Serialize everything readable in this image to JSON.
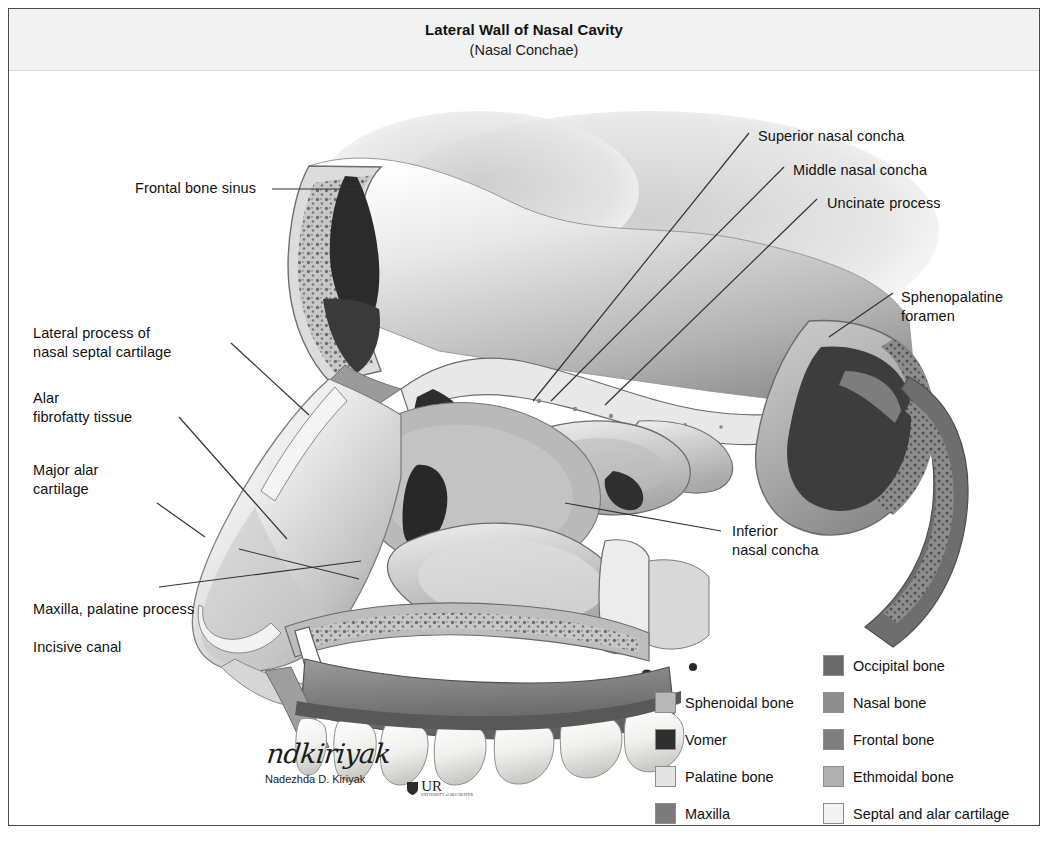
{
  "figure": {
    "title_main": "Lateral Wall of Nasal Cavity",
    "title_sub": "(Nasal Conchae)"
  },
  "labels": [
    {
      "id": "frontal-bone-sinus",
      "text": "Frontal bone sinus"
    },
    {
      "id": "lateral-process-septal-cartilage",
      "text": "Lateral process of\nnasal septal cartilage"
    },
    {
      "id": "alar-fibrofatty-tissue",
      "text": "Alar\nfibrofatty tissue"
    },
    {
      "id": "major-alar-cartilage",
      "text": "Major alar\ncartilage"
    },
    {
      "id": "maxilla-palatine-process",
      "text": "Maxilla, palatine process"
    },
    {
      "id": "incisive-canal",
      "text": "Incisive canal"
    },
    {
      "id": "superior-nasal-concha",
      "text": "Superior nasal concha"
    },
    {
      "id": "middle-nasal-concha",
      "text": "Middle nasal concha"
    },
    {
      "id": "uncinate-process",
      "text": "Uncinate process"
    },
    {
      "id": "sphenopalatine-foramen",
      "text": "Sphenopalatine\nforamen"
    },
    {
      "id": "inferior-nasal-concha",
      "text": "Inferior\nnasal concha"
    }
  ],
  "legend": {
    "left_column": [
      {
        "label": "Sphenoidal bone",
        "color": "#b8b8b8"
      },
      {
        "label": "Vomer",
        "color": "#2e2e2e"
      },
      {
        "label": "Palatine bone",
        "color": "#e4e4e4"
      },
      {
        "label": "Maxilla",
        "color": "#7b7b7b"
      }
    ],
    "right_column": [
      {
        "label": "Occipital bone",
        "color": "#6a6a6a"
      },
      {
        "label": "Nasal bone",
        "color": "#8e8e8e"
      },
      {
        "label": "Frontal bone",
        "color": "#7f7f7f"
      },
      {
        "label": "Ethmoidal bone",
        "color": "#b0b0b0"
      },
      {
        "label": "Septal and alar cartilage",
        "color": "#f2f2f2"
      }
    ]
  },
  "signature": {
    "script": "ndkiriyak",
    "printed": "Nadezhda D. Kiriyak",
    "logo_text": "UR",
    "logo_sub": "UNIVERSITY of ROCHESTER"
  },
  "palette": {
    "frame_border": "#4a4a4a",
    "title_band": "#f2f2f2",
    "text": "#111111",
    "leader_line": "#333333"
  }
}
